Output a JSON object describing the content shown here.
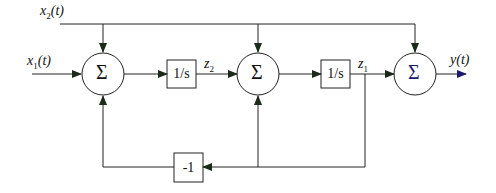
{
  "diagram": {
    "type": "block-diagram",
    "inputs": {
      "x1": "x",
      "x1_sub": "1",
      "x1_arg": "(t)",
      "x2": "x",
      "x2_sub": "2",
      "x2_arg": "(t)"
    },
    "output": {
      "label": "y(t)"
    },
    "summers": [
      {
        "symbol": "Σ"
      },
      {
        "symbol": "Σ"
      },
      {
        "symbol": "Σ"
      }
    ],
    "blocks": [
      {
        "label": "1/s"
      },
      {
        "label": "1/s"
      },
      {
        "label": "-1"
      }
    ],
    "states": {
      "z2": "z",
      "z2_sub": "2",
      "z1": "z",
      "z1_sub": "1"
    },
    "colors": {
      "line": "#222222",
      "arrow_green": "#1e4a1e",
      "arrow_blue": "#1a1a6e"
    }
  }
}
